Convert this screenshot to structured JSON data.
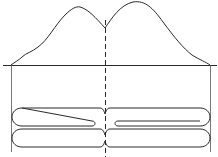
{
  "diagram": {
    "title": "",
    "elements": [
      {
        "name": "distribution-curve",
        "shape": "bimodal",
        "left_peak_height": "lower",
        "right_peak_height": "higher"
      },
      {
        "name": "baseline",
        "orientation": "horizontal"
      },
      {
        "name": "centromere-line",
        "style": "dashed",
        "orientation": "vertical"
      },
      {
        "name": "left-boundary",
        "orientation": "vertical"
      },
      {
        "name": "right-boundary",
        "orientation": "vertical"
      },
      {
        "name": "chromatid-top"
      },
      {
        "name": "chromatid-bottom"
      }
    ],
    "colors": {
      "stroke": "#2a2a2a",
      "background": "#ffffff"
    }
  }
}
